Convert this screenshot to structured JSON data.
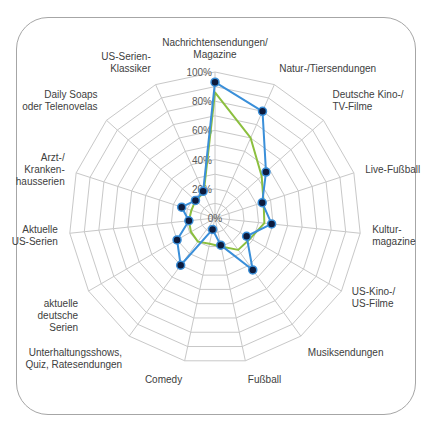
{
  "chart_data": {
    "type": "radar",
    "title": "",
    "categories": [
      "Nachrichtensendungen/ Magazine",
      "Natur-/Tiersendungen",
      "Deutsche Kino-/ TV-Filme",
      "Live-Fußball",
      "Kultur- magazine",
      "US-Kino-/ US-Filme",
      "Musiksendungen",
      "Fußball",
      "Comedy",
      "Unterhaltungsshows, Quiz, Ratesendungen",
      "aktuelle deutsche Serien",
      "Aktuelle US-Serien",
      "Arzt-/ Kranken- hausserien",
      "Daily Soaps oder Telenovelas",
      "US-Serien- Klassiker"
    ],
    "category_lines": [
      [
        "Nachrichtensendungen/",
        "Magazine"
      ],
      [
        "Natur-/Tiersendungen"
      ],
      [
        "Deutsche Kino-/",
        "TV-Filme"
      ],
      [
        "Live-Fußball"
      ],
      [
        "Kultur-",
        "magazine"
      ],
      [
        "US-Kino-/",
        "US-Filme"
      ],
      [
        "Musiksendungen"
      ],
      [
        "Fußball"
      ],
      [
        "Comedy"
      ],
      [
        "Unterhaltungsshows,",
        "Quiz, Ratesendungen"
      ],
      [
        "aktuelle",
        "deutsche",
        "Serien"
      ],
      [
        "Aktuelle",
        "US-Serien"
      ],
      [
        "Arzt-/",
        "Kranken-",
        "hausserien"
      ],
      [
        "Daily Soaps",
        "oder Telenovelas"
      ],
      [
        "US-Serien-",
        "Klassiker"
      ]
    ],
    "series": [
      {
        "name": "Series 1",
        "color": "#3a8fd9",
        "marker_color": "#0d1b3d",
        "markers": true,
        "values": [
          93,
          80,
          47,
          34,
          39,
          25,
          44,
          19,
          8,
          40,
          30,
          18,
          24,
          18,
          20
        ]
      },
      {
        "name": "Series 2",
        "color": "#8cbf3f",
        "markers": false,
        "values": [
          86,
          60,
          43,
          35,
          34,
          28,
          27,
          20,
          18,
          20,
          19,
          18,
          17,
          18,
          19
        ]
      }
    ],
    "ticks": [
      "0%",
      "20%",
      "40%",
      "60%",
      "80%",
      "100%"
    ],
    "rlim": [
      0,
      100
    ],
    "grid_rings": 10,
    "grid_color": "#c8c8c8",
    "legend": "none"
  }
}
